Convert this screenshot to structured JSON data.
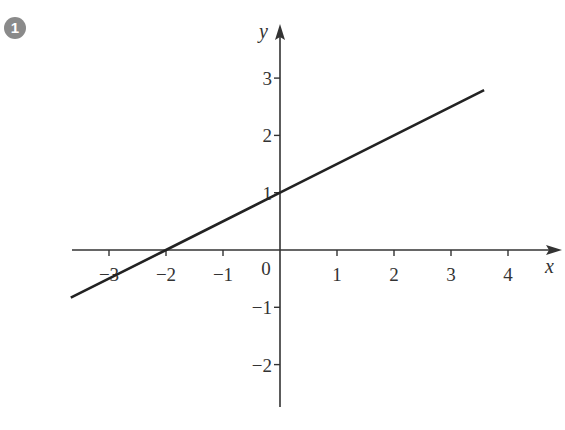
{
  "badge": {
    "label": "1"
  },
  "chart_data": {
    "type": "line",
    "title": "",
    "xlabel": "x",
    "ylabel": "y",
    "xlim": [
      -3.7,
      4.9
    ],
    "ylim": [
      -2.7,
      3.8
    ],
    "x_ticks": [
      -3,
      -2,
      -1,
      1,
      2,
      3,
      4
    ],
    "x_tick_labels": [
      "−3",
      "−2",
      "−1",
      "1",
      "2",
      "3",
      "4"
    ],
    "y_ticks": [
      -2,
      -1,
      1,
      2,
      3
    ],
    "y_tick_labels": [
      "−2",
      "−1",
      "1",
      "2",
      "3"
    ],
    "origin_label": "0",
    "grid": false,
    "legend": null,
    "series": [
      {
        "name": "y = 0.5x + 1",
        "equation": {
          "slope": 0.5,
          "intercept": 1
        },
        "x": [
          -3.67,
          -2,
          0,
          3.58
        ],
        "y": [
          -0.83,
          0,
          1,
          2.79
        ]
      }
    ],
    "annotations": {
      "x_intercept": [
        -2,
        0
      ],
      "y_intercept": [
        0,
        1
      ]
    }
  },
  "colors": {
    "axis": "#333333",
    "line": "#222222",
    "badge": "#8a8a8a"
  }
}
